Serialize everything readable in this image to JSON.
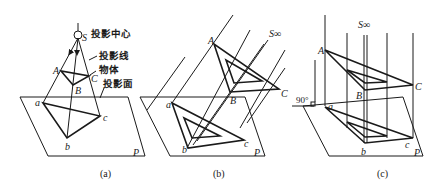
{
  "figure": {
    "panels": [
      {
        "caption": "(a)",
        "annotations": {
          "center": "投影中心",
          "center_label": "S",
          "ray": "投影线",
          "object": "物体",
          "plane": "投影面"
        },
        "labels": {
          "A": "A",
          "B": "B",
          "C": "C",
          "a": "a",
          "b": "b",
          "c": "c",
          "P": "P"
        }
      },
      {
        "caption": "(b)",
        "direction_label": "S∞",
        "labels": {
          "A": "A",
          "B": "B",
          "C": "C",
          "a": "a",
          "b": "b",
          "c": "c",
          "P": "P"
        }
      },
      {
        "caption": "(c)",
        "direction_label": "S∞",
        "angle_label": "90°",
        "labels": {
          "A": "A",
          "B": "B",
          "C": "C",
          "a": "a",
          "b": "b",
          "c": "c",
          "P": "P"
        }
      }
    ]
  }
}
